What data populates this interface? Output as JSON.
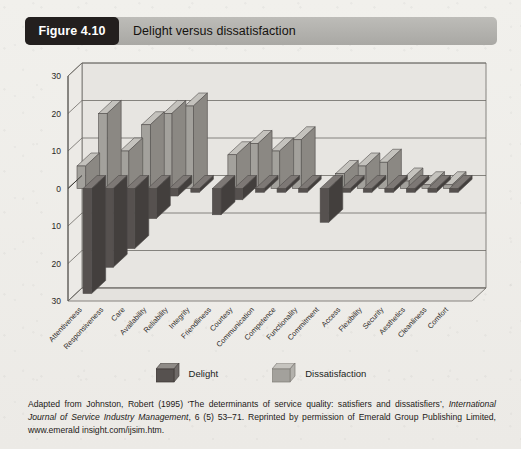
{
  "figure": {
    "tag": "Figure 4.10",
    "title": "Delight versus dissatisfaction"
  },
  "legend": {
    "items": [
      {
        "label": "Delight",
        "color": "#56514f"
      },
      {
        "label": "Dissatisfaction",
        "color": "#a3a19c"
      }
    ]
  },
  "caption": {
    "line1_a": "Adapted from Johnston, Robert (1995) ‘The determinants of service quality: satisfiers and dissatisfiers’,",
    "line2_italic": "International Journal of Service Industry Management",
    "line2_b": ", 6 (5) 53–71. Reprinted by permission of Emerald Group",
    "line3": "Publishing Limited, www.emerald insight.com/ijsim.htm."
  },
  "chart_data": {
    "type": "bar",
    "title": "Delight versus dissatisfaction",
    "xlabel": "",
    "ylabel": "",
    "ylim": [
      -30,
      30
    ],
    "yticks": [
      30,
      20,
      10,
      0,
      10,
      20,
      30
    ],
    "ytick_values": [
      30,
      20,
      10,
      0,
      -10,
      -20,
      -30
    ],
    "grid": true,
    "legend_position": "bottom",
    "categories": [
      "Attentiveness",
      "Responsiveness",
      "Care",
      "Availability",
      "Reliability",
      "Integrity",
      "Friendliness",
      "Courtesy",
      "Communication",
      "Competence",
      "Functionality",
      "Commitment",
      "Access",
      "Flexibility",
      "Security",
      "Aesthetics",
      "Cleanliness",
      "Comfort"
    ],
    "series": [
      {
        "name": "Dissatisfaction",
        "color": "#a3a19c",
        "values": [
          6,
          20,
          10,
          17,
          20,
          22,
          0,
          9,
          12,
          10,
          13,
          0,
          4,
          6,
          7,
          2,
          1,
          1
        ]
      },
      {
        "name": "Delight",
        "color": "#56514f",
        "values": [
          -28,
          -21,
          -16,
          -8,
          -2,
          -1,
          -7,
          -3,
          -1,
          -1,
          -1,
          -9,
          -1,
          -1,
          -1,
          -1,
          -1,
          -1
        ]
      }
    ]
  }
}
